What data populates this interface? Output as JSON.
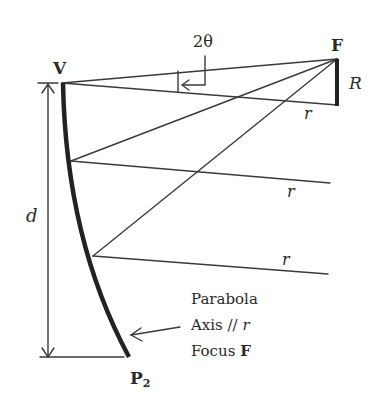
{
  "diagram": {
    "type": "geometric-optics",
    "labels": {
      "vertex": "V",
      "focus": "F",
      "endpoint_main": "P",
      "endpoint_sub": "2",
      "angle": "2θ",
      "radius_bar": "R",
      "ray_1": "r",
      "ray_2": "r",
      "ray_3": "r",
      "distance": "d"
    },
    "annotation": {
      "line1": "Parabola",
      "line2_prefix": "Axis // ",
      "line2_var": "r",
      "line3_prefix": "Focus ",
      "line3_var": "F"
    },
    "colors": {
      "stroke": "#333333",
      "curve": "#222222",
      "text": "#2a2a2a"
    }
  }
}
